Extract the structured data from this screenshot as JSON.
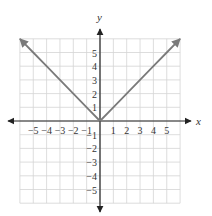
{
  "chart_data": {
    "type": "line",
    "title": "",
    "xlabel": "x",
    "ylabel": "y",
    "xlim": [
      -6,
      6
    ],
    "ylim": [
      -6,
      6
    ],
    "grid": true,
    "x_ticks": [
      -5,
      -4,
      -3,
      -2,
      -1,
      1,
      2,
      3,
      4,
      5
    ],
    "y_ticks": [
      -5,
      -4,
      -3,
      -2,
      -1,
      1,
      2,
      3,
      4,
      5
    ],
    "x_tick_labels": [
      "−5",
      "−4",
      "−3",
      "−2",
      "−1",
      "1",
      "2",
      "3",
      "4",
      "5"
    ],
    "y_tick_labels": [
      "−5",
      "−4",
      "−3",
      "−2",
      "−1",
      "1",
      "2",
      "3",
      "4",
      "5"
    ],
    "series": [
      {
        "name": "y = |x|",
        "x": [
          -6,
          -5,
          -4,
          -3,
          -2,
          -1,
          0,
          1,
          2,
          3,
          4,
          5,
          6
        ],
        "y": [
          6,
          5,
          4,
          3,
          2,
          1,
          0,
          1,
          2,
          3,
          4,
          5,
          6
        ],
        "color": "#7a7a7a",
        "arrows_at_ends": true
      }
    ]
  },
  "colors": {
    "grid": "#d4d4d4",
    "axis": "#222222",
    "curve": "#7a7a7a"
  }
}
